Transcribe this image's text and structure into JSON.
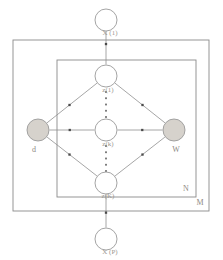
{
  "diagram": {
    "type": "probabilistic-graphical-model-plate-diagram",
    "canvas": {
      "width": 223,
      "height": 260
    },
    "plates": [
      {
        "id": "outer",
        "label": "M",
        "x": 13,
        "y": 40,
        "width": 196,
        "height": 171,
        "label_x": 200,
        "label_y": 203
      },
      {
        "id": "inner",
        "label": "N",
        "x": 57,
        "y": 60,
        "width": 139,
        "height": 137,
        "label_x": 186,
        "label_y": 189
      }
    ],
    "nodes": [
      {
        "id": "x_top",
        "label": "X (1)",
        "cx": 106,
        "cy": 20,
        "r": 11,
        "shaded": false,
        "label_x": 110,
        "label_y": 33
      },
      {
        "id": "z_1",
        "label": "z(1)",
        "cx": 106,
        "cy": 76,
        "r": 11,
        "shaded": false,
        "label_x": 108,
        "label_y": 90
      },
      {
        "id": "z_k",
        "label": "z(k)",
        "cx": 106,
        "cy": 130,
        "r": 11,
        "shaded": false,
        "label_x": 108,
        "label_y": 144
      },
      {
        "id": "z_K",
        "label": "z(K)",
        "cx": 106,
        "cy": 183,
        "r": 11,
        "shaded": false,
        "label_x": 108,
        "label_y": 196
      },
      {
        "id": "d",
        "label": "d",
        "cx": 38,
        "cy": 130,
        "r": 11,
        "shaded": true,
        "label_x": 34,
        "label_y": 150
      },
      {
        "id": "W",
        "label": "W",
        "cx": 174,
        "cy": 130,
        "r": 11,
        "shaded": true,
        "label_x": 176,
        "label_y": 150
      },
      {
        "id": "x_bottom",
        "label": "X (P)",
        "cx": 106,
        "cy": 239,
        "r": 11,
        "shaded": false,
        "label_x": 110,
        "label_y": 252
      }
    ],
    "edges": [
      {
        "from": "z_1",
        "to": "x_top",
        "arrow_t": 0.62
      },
      {
        "from": "z_K",
        "to": "x_bottom",
        "arrow_t": 0.55
      },
      {
        "from": "d",
        "to": "z_1",
        "arrow_t": 0.45
      },
      {
        "from": "d",
        "to": "z_k",
        "arrow_t": 0.45
      },
      {
        "from": "d",
        "to": "z_K",
        "arrow_t": 0.45
      },
      {
        "from": "W",
        "to": "z_1",
        "arrow_t": 0.45
      },
      {
        "from": "W",
        "to": "z_k",
        "arrow_t": 0.45
      },
      {
        "from": "W",
        "to": "z_K",
        "arrow_t": 0.45
      }
    ],
    "ellipses": [
      {
        "id": "dots-upper",
        "x": 106,
        "y_start": 92,
        "y_end": 117,
        "count": 5
      },
      {
        "id": "dots-lower",
        "x": 106,
        "y_start": 146,
        "y_end": 171,
        "count": 5
      }
    ],
    "colors": {
      "stroke": "#8f8f8f",
      "shaded_node_fill": "#d6d2cc",
      "open_node_fill": "#ffffff",
      "label": "#9b9790",
      "arrowhead": "#4a4a4a",
      "background": "#ffffff"
    }
  }
}
